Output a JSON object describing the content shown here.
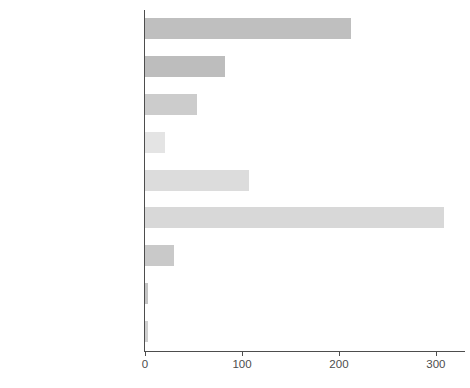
{
  "chart_data": {
    "type": "bar",
    "orientation": "horizontal",
    "title": "",
    "subtitle": "",
    "xlabel": "",
    "ylabel": "",
    "categories": [
      "Catholic",
      "Orthodox",
      "Protestant",
      "Christian other",
      "Christian unassigned",
      "Sunni",
      "Shi'i",
      "Islam other",
      "Islam unassigned"
    ],
    "values": [
      212,
      83,
      54,
      21,
      107,
      308,
      30,
      3,
      3
    ],
    "bar_colors": [
      "#bfbfbf",
      "#bdbdbd",
      "#cccccc",
      "#e4e4e4",
      "#dcdcdc",
      "#d8d8d8",
      "#c9c9c9",
      "#c4c4c4",
      "#cfcfcf"
    ],
    "xlim": [
      0,
      330
    ],
    "x_ticks": [
      0,
      100,
      200,
      300
    ],
    "x_tick_labels": [
      "0",
      "100",
      "200",
      "300"
    ],
    "grid": false,
    "legend": null,
    "axis_color": "#4d4d4d",
    "background": "#ffffff"
  },
  "caption": {
    "text": ""
  }
}
